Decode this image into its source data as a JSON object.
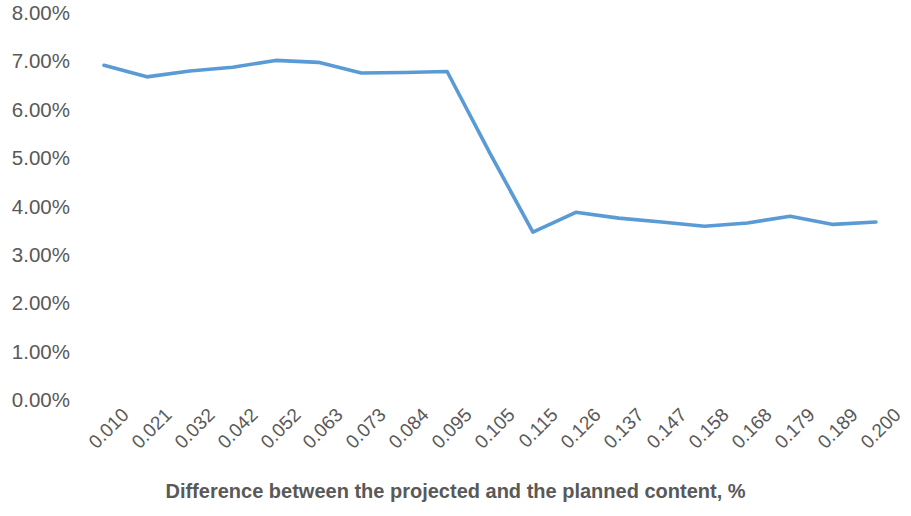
{
  "chart_data": {
    "type": "line",
    "title": "",
    "xlabel": "Difference between the projected and the planned content, %",
    "ylabel": "",
    "categories": [
      "0.010",
      "0.021",
      "0.032",
      "0.042",
      "0.052",
      "0.063",
      "0.073",
      "0.084",
      "0.095",
      "0.105",
      "0.115",
      "0.126",
      "0.137",
      "0.147",
      "0.158",
      "0.168",
      "0.179",
      "0.189",
      "0.200"
    ],
    "values": [
      6.92,
      6.68,
      6.8,
      6.88,
      7.02,
      6.98,
      6.76,
      6.77,
      6.79,
      5.1,
      3.47,
      3.88,
      3.76,
      3.68,
      3.59,
      3.66,
      3.8,
      3.63,
      3.68
    ],
    "y_tick_labels": [
      "8.00%",
      "7.00%",
      "6.00%",
      "5.00%",
      "4.00%",
      "3.00%",
      "2.00%",
      "1.00%",
      "0.00%"
    ],
    "y_tick_values": [
      8,
      7,
      6,
      5,
      4,
      3,
      2,
      1,
      0
    ],
    "ylim": [
      0,
      8
    ],
    "grid": false,
    "legend": false,
    "series": [
      {
        "name": "Series 1",
        "color": "#5B9BD5",
        "values": [
          6.92,
          6.68,
          6.8,
          6.88,
          7.02,
          6.98,
          6.76,
          6.77,
          6.79,
          5.1,
          3.47,
          3.88,
          3.76,
          3.68,
          3.59,
          3.66,
          3.8,
          3.63,
          3.68
        ]
      }
    ]
  },
  "style": {
    "line_color": "#5B9BD5",
    "text_color": "#595959",
    "background": "#FFFFFF"
  }
}
